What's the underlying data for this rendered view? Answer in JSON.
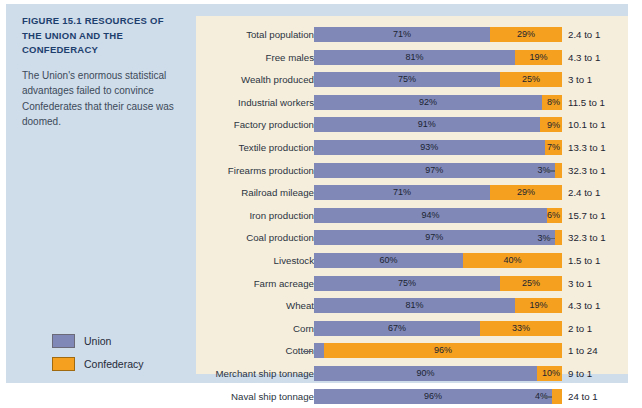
{
  "figure": {
    "title_number": "FIGURE 15.1",
    "title_text": "RESOURCES OF THE UNION AND THE CONFEDERACY",
    "description": "The Union's enormous statistical advantages failed to convince Confederates that their cause was doomed."
  },
  "legend": {
    "items": [
      {
        "label": "Union",
        "color": "#8088b8",
        "icon": "legend-swatch-icon"
      },
      {
        "label": "Confederacy",
        "color": "#f5a01e",
        "icon": "legend-swatch-icon"
      }
    ]
  },
  "colors": {
    "union": "#8088b8",
    "confederacy": "#f5a01e",
    "panel_background": "#f5eedd",
    "figure_background": "#cfdcea",
    "title": "#1d3f6e"
  },
  "chart_data": {
    "type": "bar",
    "title": "FIGURE 15.1 RESOURCES OF THE UNION AND THE CONFEDERACY",
    "subtitle": "The Union's enormous statistical advantages failed to convince Confederates that their cause was doomed.",
    "orientation": "horizontal",
    "stacked": true,
    "normalized_percent": true,
    "xlabel": "",
    "ylabel": "",
    "xlim": [
      0,
      100
    ],
    "grid": false,
    "legend_position": "left",
    "series": [
      {
        "name": "Union",
        "color": "#8088b8"
      },
      {
        "name": "Confederacy",
        "color": "#f5a01e"
      }
    ],
    "categories": [
      "Total population",
      "Free males",
      "Wealth produced",
      "Industrial workers",
      "Factory production",
      "Textile production",
      "Firearms production",
      "Railroad mileage",
      "Iron production",
      "Coal production",
      "Livestock",
      "Farm acreage",
      "Wheat",
      "Corn",
      "Cotton",
      "Merchant ship tonnage",
      "Naval ship tonnage"
    ],
    "rows": [
      {
        "category": "Total population",
        "union": 71,
        "confederacy": 29,
        "union_label": "71%",
        "confederacy_label": "29%",
        "ratio": "2.4 to 1"
      },
      {
        "category": "Free males",
        "union": 81,
        "confederacy": 19,
        "union_label": "81%",
        "confederacy_label": "19%",
        "ratio": "4.3 to 1"
      },
      {
        "category": "Wealth produced",
        "union": 75,
        "confederacy": 25,
        "union_label": "75%",
        "confederacy_label": "25%",
        "ratio": "3 to 1"
      },
      {
        "category": "Industrial workers",
        "union": 92,
        "confederacy": 8,
        "union_label": "92%",
        "confederacy_label": "8%",
        "ratio": "11.5 to 1"
      },
      {
        "category": "Factory production",
        "union": 91,
        "confederacy": 9,
        "union_label": "91%",
        "confederacy_label": "9%",
        "ratio": "10.1 to 1"
      },
      {
        "category": "Textile production",
        "union": 93,
        "confederacy": 7,
        "union_label": "93%",
        "confederacy_label": "7%",
        "ratio": "13.3 to 1"
      },
      {
        "category": "Firearms production",
        "union": 97,
        "confederacy": 3,
        "union_label": "97%",
        "confederacy_label": "3%",
        "ratio": "32.3 to 1",
        "confederacy_label_inside_union": true
      },
      {
        "category": "Railroad mileage",
        "union": 71,
        "confederacy": 29,
        "union_label": "71%",
        "confederacy_label": "29%",
        "ratio": "2.4 to 1"
      },
      {
        "category": "Iron production",
        "union": 94,
        "confederacy": 6,
        "union_label": "94%",
        "confederacy_label": "6%",
        "ratio": "15.7 to 1"
      },
      {
        "category": "Coal production",
        "union": 97,
        "confederacy": 3,
        "union_label": "97%",
        "confederacy_label": "3%",
        "ratio": "32.3 to 1",
        "confederacy_label_inside_union": true
      },
      {
        "category": "Livestock",
        "union": 60,
        "confederacy": 40,
        "union_label": "60%",
        "confederacy_label": "40%",
        "ratio": "1.5 to 1"
      },
      {
        "category": "Farm acreage",
        "union": 75,
        "confederacy": 25,
        "union_label": "75%",
        "confederacy_label": "25%",
        "ratio": "3 to 1"
      },
      {
        "category": "Wheat",
        "union": 81,
        "confederacy": 19,
        "union_label": "81%",
        "confederacy_label": "19%",
        "ratio": "4.3 to 1"
      },
      {
        "category": "Corn",
        "union": 67,
        "confederacy": 33,
        "union_label": "67%",
        "confederacy_label": "33%",
        "ratio": "2 to 1"
      },
      {
        "category": "Cotton",
        "union": 4,
        "confederacy": 96,
        "union_label": "4%",
        "confederacy_label": "96%",
        "ratio": "1 to 24",
        "union_label_outside": true
      },
      {
        "category": "Merchant ship tonnage",
        "union": 90,
        "confederacy": 10,
        "union_label": "90%",
        "confederacy_label": "10%",
        "ratio": "9 to 1"
      },
      {
        "category": "Naval ship tonnage",
        "union": 96,
        "confederacy": 4,
        "union_label": "96%",
        "confederacy_label": "4%",
        "ratio": "24 to 1",
        "confederacy_label_inside_union": true
      }
    ]
  }
}
